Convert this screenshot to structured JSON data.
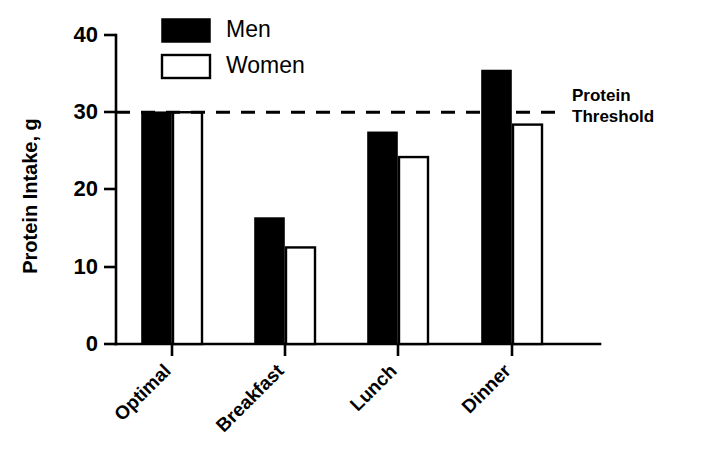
{
  "chart_data": {
    "type": "bar",
    "title": "",
    "xlabel": "",
    "ylabel": "Protein Intake, g",
    "ylim": [
      0,
      40
    ],
    "yticks": [
      0,
      10,
      20,
      30,
      40
    ],
    "ytick_labels": [
      "0",
      "10",
      "20",
      "30",
      "40"
    ],
    "grid": false,
    "legend_position": "top-center",
    "categories": [
      "Optimal",
      "Breakfast",
      "Lunch",
      "Dinner"
    ],
    "series": [
      {
        "name": "Men",
        "values": [
          30.0,
          16.3,
          27.4,
          35.4
        ],
        "color": "#000000",
        "fill": "solid"
      },
      {
        "name": "Women",
        "values": [
          30.0,
          12.5,
          24.2,
          28.4
        ],
        "color": "#ffffff",
        "fill": "open"
      }
    ],
    "annotations": [
      {
        "name": "protein-threshold",
        "type": "hline",
        "value": 30,
        "style": "dashed",
        "label_line_1": "Protein",
        "label_line_2": "Threshold"
      }
    ]
  },
  "legend": {
    "items": [
      {
        "label": "Men",
        "swatch": "filled-square-icon"
      },
      {
        "label": "Women",
        "swatch": "open-square-icon"
      }
    ]
  }
}
